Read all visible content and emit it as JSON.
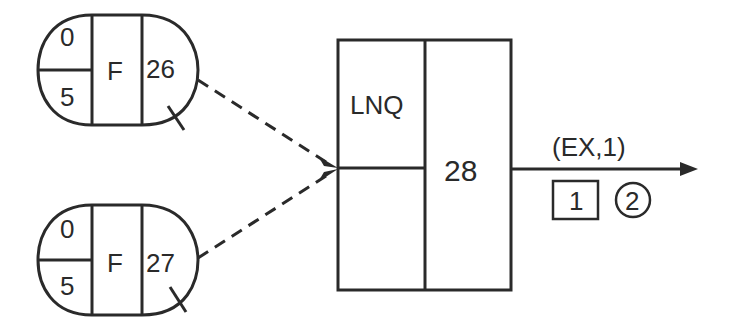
{
  "diagram": {
    "type": "network-flow",
    "colors": {
      "stroke": "#2a2a2a",
      "background": "#ffffff"
    },
    "source_nodes": [
      {
        "id": "node-26",
        "top_value": "0",
        "bottom_value": "5",
        "type_label": "F",
        "node_number": "26"
      },
      {
        "id": "node-27",
        "top_value": "0",
        "bottom_value": "5",
        "type_label": "F",
        "node_number": "27"
      }
    ],
    "target_node": {
      "id": "node-28",
      "type_label": "LNQ",
      "node_number": "28"
    },
    "output": {
      "edge_label": "(EX,1)",
      "boxed_value": "1",
      "circled_value": "2"
    },
    "edges": [
      {
        "from": "26",
        "to": "28",
        "style": "dashed"
      },
      {
        "from": "27",
        "to": "28",
        "style": "dashed"
      },
      {
        "from": "28",
        "to": "output",
        "style": "solid"
      }
    ]
  }
}
